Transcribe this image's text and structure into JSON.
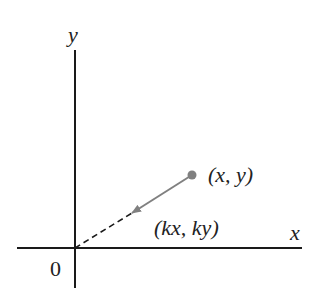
{
  "diagram": {
    "axes": {
      "x_label": "x",
      "y_label": "y",
      "origin_label": "0"
    },
    "point": {
      "label": "(x, y)",
      "color": "#808080"
    },
    "scaled_point": {
      "label": "(kx, ky)"
    },
    "colors": {
      "axis": "#1a1a1a",
      "arrow": "#808080",
      "dashed": "#1a1a1a"
    }
  }
}
